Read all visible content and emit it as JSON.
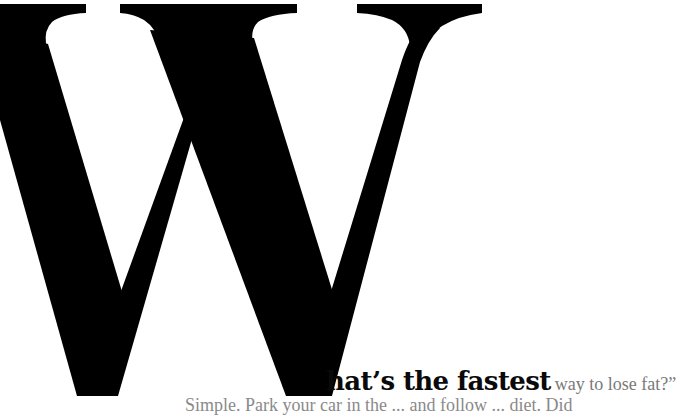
{
  "article": {
    "dropcap_letter": "W",
    "headline": {
      "bold": "hat’s the fastest",
      "light": "way to lose fat?”"
    },
    "body_first_line": "Simple. Park your car in the ... and follow ... diet. Did"
  },
  "colors": {
    "dropcap": "#000000",
    "headline_bold": "#0a0a0a",
    "headline_light": "#7a7a7a",
    "body_text": "#8a8a8a",
    "background": "#ffffff"
  }
}
